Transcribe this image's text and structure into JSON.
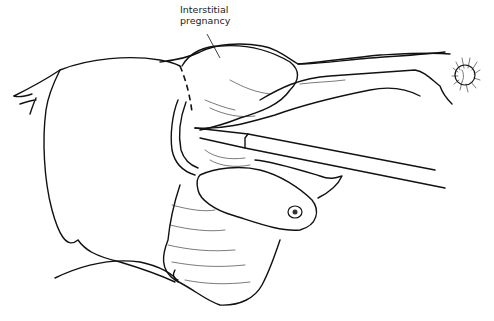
{
  "figure": {
    "labels": [
      {
        "id": "interstitial",
        "line1": "Interstitial",
        "line2": "pregnancy"
      }
    ],
    "colors": {
      "ink": "#111111",
      "background": "#ffffff"
    }
  }
}
